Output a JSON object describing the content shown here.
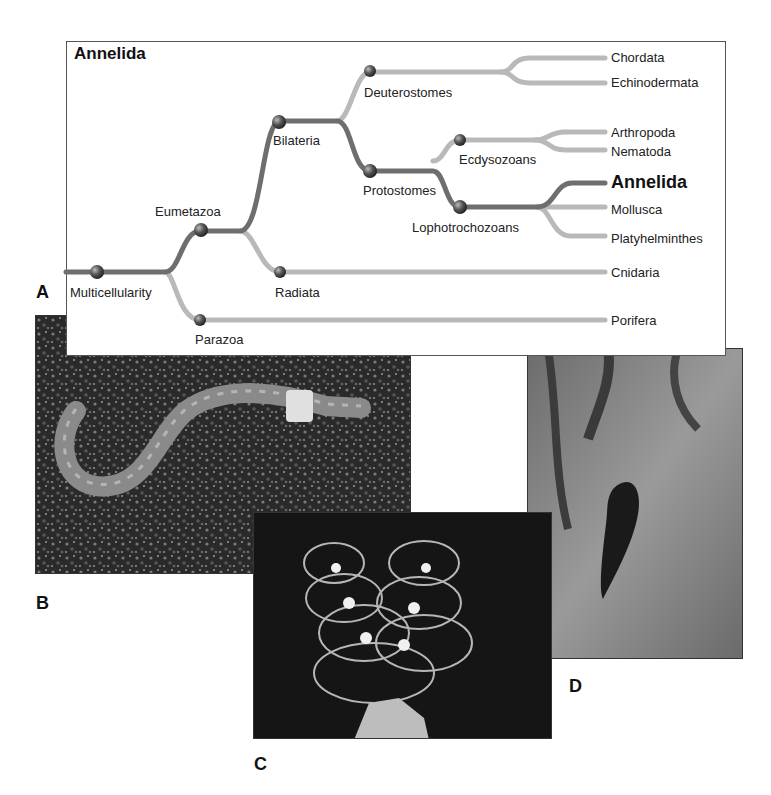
{
  "figure": {
    "tree_title": "Annelida",
    "panel_labels": {
      "a": "A",
      "b": "B",
      "c": "C",
      "d": "D"
    }
  },
  "tree": {
    "nodes": {
      "multicellularity": "Multicellularity",
      "parazoa": "Parazoa",
      "eumetazoa": "Eumetazoa",
      "radiata": "Radiata",
      "bilateria": "Bilateria",
      "deuterostomes": "Deuterostomes",
      "protostomes": "Protostomes",
      "ecdysozoans": "Ecdysozoans",
      "lophotrochozoans": "Lophotrochozoans"
    },
    "leaves": {
      "chordata": "Chordata",
      "echinodermata": "Echinodermata",
      "arthropoda": "Arthropoda",
      "nematoda": "Nematoda",
      "annelida": "Annelida",
      "mollusca": "Mollusca",
      "platyhelminthes": "Platyhelminthes",
      "cnidaria": "Cnidaria",
      "porifera": "Porifera"
    },
    "colors": {
      "main_path": "#6e6e6e",
      "side_path": "#b9b9b9",
      "node": "#3a3a3a"
    }
  },
  "photos": {
    "b": {
      "subject": "earthworm on soil"
    },
    "c": {
      "subject": "tube worms (feather dusters)"
    },
    "d": {
      "subject": "leech on hand"
    }
  }
}
